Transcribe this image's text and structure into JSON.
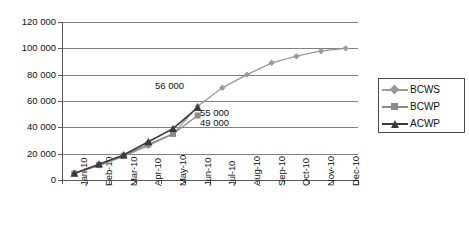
{
  "chart_data": {
    "type": "line",
    "title": "",
    "subtitle": "",
    "xlabel": "",
    "ylabel": "",
    "ylim": [
      0,
      120000
    ],
    "ytick_labels": [
      "0",
      "20 000",
      "40 000",
      "60 000",
      "80 000",
      "100 000",
      "120 000"
    ],
    "ytick_values": [
      0,
      20000,
      40000,
      60000,
      80000,
      100000,
      120000
    ],
    "grid": true,
    "legend_position": "right",
    "categories": [
      "Jan-10",
      "Feb-10",
      "Mar-10",
      "Apr-10",
      "May-10",
      "Jun-10",
      "Jul-10",
      "Aug-10",
      "Sep-10",
      "Oct-10",
      "Nov-10",
      "Dec-10"
    ],
    "series": [
      {
        "name": "BCWS",
        "marker": "diamond",
        "color": "#9a9a9a",
        "values": [
          5000,
          11000,
          18000,
          26000,
          35000,
          56000,
          70000,
          80000,
          89000,
          94000,
          98000,
          100000
        ]
      },
      {
        "name": "BCWP",
        "marker": "square",
        "color": "#8a8a8a",
        "values": [
          5000,
          11500,
          18500,
          27000,
          35000,
          49000,
          null,
          null,
          null,
          null,
          null,
          null
        ]
      },
      {
        "name": "ACWP",
        "marker": "triangle",
        "color": "#3a3a3a",
        "values": [
          5000,
          12000,
          19000,
          29000,
          39000,
          55000,
          null,
          null,
          null,
          null,
          null,
          null
        ]
      }
    ],
    "annotations": [
      {
        "text": "56 000",
        "x_category": "Jun-10",
        "value": 56000,
        "px_left": 155,
        "px_top": 80
      },
      {
        "text": "55 000",
        "x_category": "Jun-10",
        "value": 55000,
        "px_left": 200,
        "px_top": 107
      },
      {
        "text": "49 000",
        "x_category": "Jun-10",
        "value": 49000,
        "px_left": 200,
        "px_top": 117
      }
    ]
  },
  "legend": {
    "items": [
      {
        "label": "BCWS"
      },
      {
        "label": "BCWP"
      },
      {
        "label": "ACWP"
      }
    ]
  },
  "colors": {
    "bcws": "#9a9a9a",
    "bcwp": "#8a8a8a",
    "acwp": "#3a3a3a",
    "axis": "#5a5a5a",
    "grid": "#808080",
    "text": "#111111",
    "background": "#ffffff"
  }
}
